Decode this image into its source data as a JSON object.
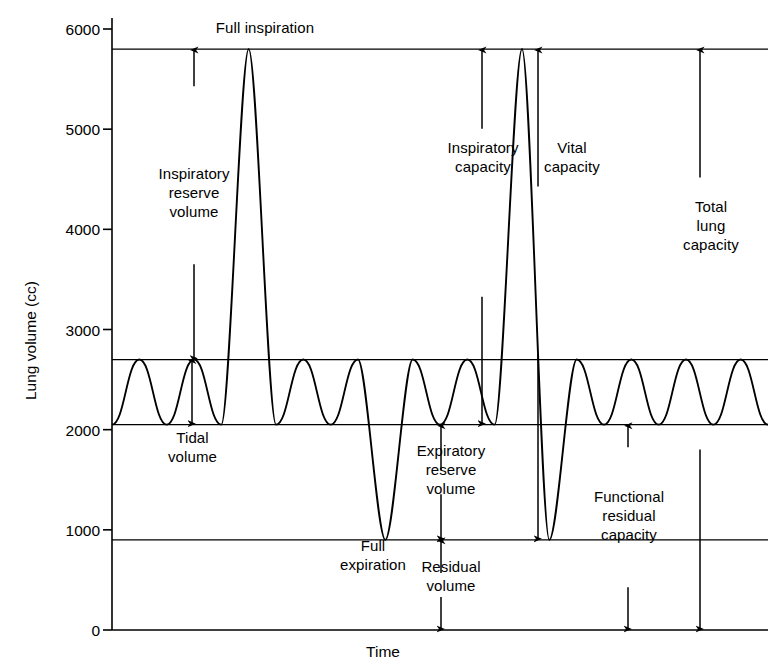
{
  "chart_data": {
    "type": "line",
    "title": "",
    "xlabel": "Time",
    "ylabel": "Lung volume (cc)",
    "ylim": [
      0,
      6000
    ],
    "yticks": [
      0,
      1000,
      2000,
      3000,
      4000,
      5000,
      6000
    ],
    "ytick_labels": [
      "0",
      "1000",
      "2000",
      "3000",
      "4000",
      "5000",
      "6000"
    ],
    "xticks": [],
    "grid": false,
    "legend": null,
    "line_color": "#000000",
    "levels": {
      "full_inspiration": 5800,
      "tidal_peak": 2700,
      "tidal_trough": 2050,
      "full_expiration": 900,
      "baseline": 0
    },
    "reference_lines": [
      5800,
      2700,
      2050,
      900,
      0
    ],
    "series": [
      {
        "name": "Spirogram",
        "description": "Tidal breathing interrupted by one maximal inspiration and two maximal expirations",
        "points": [
          {
            "t": 0.0,
            "v": 2050
          },
          {
            "t": 0.5,
            "v": 2700
          },
          {
            "t": 1.0,
            "v": 2050
          },
          {
            "t": 1.5,
            "v": 2700
          },
          {
            "t": 2.0,
            "v": 2050
          },
          {
            "t": 2.5,
            "v": 5800
          },
          {
            "t": 3.0,
            "v": 2050
          },
          {
            "t": 3.5,
            "v": 2700
          },
          {
            "t": 4.0,
            "v": 2050
          },
          {
            "t": 4.5,
            "v": 2700
          },
          {
            "t": 5.0,
            "v": 900
          },
          {
            "t": 5.5,
            "v": 2700
          },
          {
            "t": 6.0,
            "v": 2050
          },
          {
            "t": 6.5,
            "v": 2700
          },
          {
            "t": 7.0,
            "v": 2050
          },
          {
            "t": 7.5,
            "v": 5800
          },
          {
            "t": 8.0,
            "v": 900
          },
          {
            "t": 8.5,
            "v": 2700
          },
          {
            "t": 9.0,
            "v": 2050
          },
          {
            "t": 9.5,
            "v": 2700
          },
          {
            "t": 10.0,
            "v": 2050
          },
          {
            "t": 10.5,
            "v": 2700
          },
          {
            "t": 11.0,
            "v": 2050
          },
          {
            "t": 11.5,
            "v": 2700
          },
          {
            "t": 12.0,
            "v": 2050
          }
        ]
      }
    ],
    "annotations": [
      {
        "name": "full-inspiration",
        "label": "Full inspiration",
        "value": 5800
      },
      {
        "name": "inspiratory-reserve-volume",
        "label": "Inspiratory\nreserve\nvolume",
        "from": 2700,
        "to": 5800,
        "amount": 3100
      },
      {
        "name": "tidal-volume",
        "label": "Tidal\nvolume",
        "from": 2050,
        "to": 2700,
        "amount": 650
      },
      {
        "name": "inspiratory-capacity",
        "label": "Inspiratory\ncapacity",
        "from": 2050,
        "to": 5800,
        "amount": 3750
      },
      {
        "name": "vital-capacity",
        "label": "Vital\ncapacity",
        "from": 900,
        "to": 5800,
        "amount": 4900
      },
      {
        "name": "expiratory-reserve-volume",
        "label": "Expiratory\nreserve\nvolume",
        "from": 900,
        "to": 2050,
        "amount": 1150
      },
      {
        "name": "residual-volume",
        "label": "Residual\nvolume",
        "from": 0,
        "to": 900,
        "amount": 900
      },
      {
        "name": "full-expiration",
        "label": "Full\nexpiration",
        "value": 900
      },
      {
        "name": "functional-residual-capacity",
        "label": "Functional\nresidual\ncapacity",
        "from": 0,
        "to": 2050,
        "amount": 2050
      },
      {
        "name": "total-lung-capacity",
        "label": "Total\nlung\ncapacity",
        "from": 0,
        "to": 5800,
        "amount": 5800
      }
    ]
  },
  "axis": {
    "y_title": "Lung volume (cc)",
    "x_title": "Time",
    "ticks": [
      "6000",
      "5000",
      "4000",
      "3000",
      "2000",
      "1000",
      "0"
    ]
  },
  "labels": {
    "full_inspiration": "Full inspiration",
    "inspiratory_reserve_volume": "Inspiratory\nreserve\nvolume",
    "tidal_volume": "Tidal\nvolume",
    "inspiratory_capacity": "Inspiratory\ncapacity",
    "vital_capacity": "Vital\ncapacity",
    "expiratory_reserve_volume": "Expiratory\nreserve\nvolume",
    "residual_volume": "Residual\nvolume",
    "full_expiration": "Full\nexpiration",
    "functional_residual_capacity": "Functional\nresidual\ncapacity",
    "total_lung_capacity": "Total\nlung\ncapacity"
  }
}
